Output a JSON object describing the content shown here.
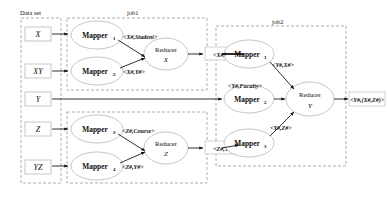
{
  "groups": {
    "dataset": "Data set",
    "job1": "job1",
    "job2": "job2"
  },
  "inputs": [
    {
      "id": "x",
      "label": "X"
    },
    {
      "id": "xy",
      "label": "XY"
    },
    {
      "id": "y",
      "label": "Y"
    },
    {
      "id": "z",
      "label": "Z"
    },
    {
      "id": "yz",
      "label": "YZ"
    }
  ],
  "job1": {
    "mappers": [
      {
        "id": "m1",
        "label": "Mapper",
        "sub": "1"
      },
      {
        "id": "m2",
        "label": "Mapper",
        "sub": "2"
      },
      {
        "id": "m3",
        "label": "Mapper",
        "sub": "3"
      },
      {
        "id": "m4",
        "label": "Mapper",
        "sub": "4"
      }
    ],
    "reducers": [
      {
        "id": "rx",
        "label": "Reducer",
        "key": "X"
      },
      {
        "id": "rz",
        "label": "Reducer",
        "key": "Z"
      }
    ],
    "edge_labels": {
      "m1_to_rx": "<X#,Student>",
      "m2_to_rx": "<X#,Y#>",
      "m3_to_rz": "<Z#,Course>",
      "m4_to_rz": "<Z#,Y#>"
    },
    "outputs": {
      "rx": "<X#,Y#>",
      "rz": "<Z#,Y#>"
    }
  },
  "job2": {
    "mappers": [
      {
        "id": "j2m1",
        "label": "Mapper",
        "sub": "1"
      },
      {
        "id": "j2m2",
        "label": "Mapper",
        "sub": "2"
      },
      {
        "id": "j2m3",
        "label": "Mapper",
        "sub": "3"
      }
    ],
    "reducer": {
      "id": "ry",
      "label": "Reducer",
      "key": "Y"
    },
    "edge_labels": {
      "m1_to_ry": "<Y#,X#>",
      "m2_to_ry": "<Y#,Faculty>",
      "m3_to_ry": "<Y#,Z#>"
    },
    "output": "<Y#,(X#,Z#)>"
  }
}
